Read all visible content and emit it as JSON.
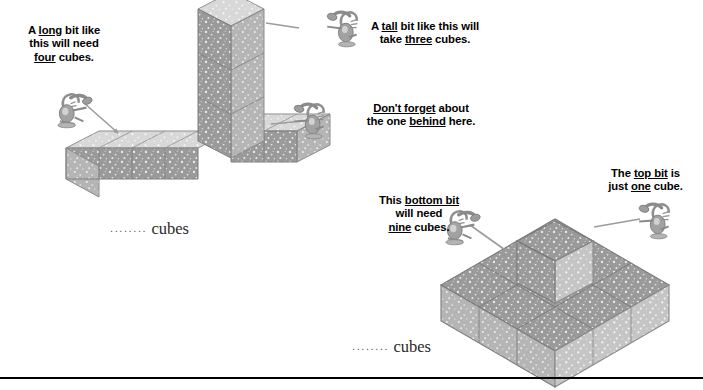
{
  "page": {
    "background": "#ffffff",
    "width": 703,
    "height": 390,
    "rule_color": "#000000"
  },
  "palette": {
    "cube_top_light": "#d8d8d8",
    "cube_left_dark": "#9a9a9a",
    "cube_right_mid": "#b5b5b5",
    "cube_top_mid": "#9a9a9a",
    "cube_right_light": "#c5c5c5",
    "speckle": "#ffffff",
    "edge": "#8a8a8a",
    "pointer": "#9b9b9b",
    "bug_body": "#8f8f8f",
    "text": "#000000"
  },
  "captions": {
    "long_bit": {
      "line1_a": "A ",
      "line1_u": "long",
      "line1_b": " bit like",
      "line2": "this will need",
      "line3_u": "four",
      "line3_b": " cubes."
    },
    "tall_bit": {
      "line1_a": "A ",
      "line1_u": "tall",
      "line1_b": " bit like this will",
      "line2_a": "take ",
      "line2_u": "three",
      "line2_b": " cubes."
    },
    "dont_forget": {
      "line1_u": "Don't forget",
      "line1_b": " about",
      "line2_a": "the one ",
      "line2_u": "behind",
      "line2_b": " here."
    },
    "bottom_bit": {
      "line1_a": "This ",
      "line1_u": "bottom bit",
      "line2": "will need",
      "line3_u": "nine",
      "line3_b": " cubes."
    },
    "top_bit": {
      "line1_a": "The ",
      "line1_u": "top bit",
      "line1_b": " is",
      "line2_a": "just ",
      "line2_u": "one",
      "line2_b": " cube."
    }
  },
  "answers": {
    "left": {
      "dots": "........",
      "label": "cubes"
    },
    "right": {
      "dots": "........",
      "label": "cubes"
    }
  },
  "figures": {
    "left_structure": {
      "name": "t-shape-cube-solid",
      "arm_long_cubes": 4,
      "tower_cubes": 3,
      "arm_short_cubes": 2,
      "hidden_cubes": 1
    },
    "right_structure": {
      "name": "stepped-cube-solid",
      "base_cubes": 9,
      "top_cubes": 1
    }
  }
}
